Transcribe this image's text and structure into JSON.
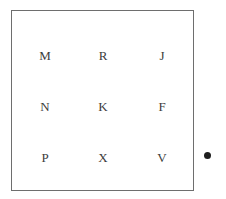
{
  "figure": {
    "background_color": "#ffffff",
    "box": {
      "name": "letter-grid-box",
      "border_color": "#6e6e6e",
      "border_width": 1,
      "fill_color": "#ffffff",
      "left": 11,
      "top": 10,
      "width": 183,
      "height": 181
    },
    "grid": {
      "rows": 3,
      "columns": 3,
      "text_color": "#3c3c3c",
      "font_size": 13,
      "column_centers": [
        44,
        102,
        161
      ],
      "row_centers": [
        55,
        106,
        157
      ],
      "cells": [
        {
          "label": "M",
          "row": 0,
          "col": 0,
          "x": 44,
          "y": 55
        },
        {
          "label": "R",
          "row": 0,
          "col": 1,
          "x": 102,
          "y": 55
        },
        {
          "label": "J",
          "row": 0,
          "col": 2,
          "x": 161,
          "y": 55
        },
        {
          "label": "N",
          "row": 1,
          "col": 0,
          "x": 44,
          "y": 106
        },
        {
          "label": "K",
          "row": 1,
          "col": 1,
          "x": 102,
          "y": 106
        },
        {
          "label": "F",
          "row": 1,
          "col": 2,
          "x": 161,
          "y": 106
        },
        {
          "label": "P",
          "row": 2,
          "col": 0,
          "x": 44,
          "y": 157
        },
        {
          "label": "X",
          "row": 2,
          "col": 1,
          "x": 102,
          "y": 157
        },
        {
          "label": "V",
          "row": 2,
          "col": 2,
          "x": 161,
          "y": 157
        }
      ],
      "rows_text": [
        [
          "M",
          "R",
          "J"
        ],
        [
          "N",
          "K",
          "F"
        ],
        [
          "P",
          "X",
          "V"
        ]
      ]
    },
    "side_marker": {
      "name": "side-dot",
      "shape": "filled-circle",
      "color": "#1e1e1e",
      "diameter": 7,
      "center_x": 207,
      "center_y": 155
    }
  }
}
